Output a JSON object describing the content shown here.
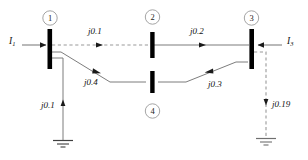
{
  "diagram": {
    "colors": {
      "bus_bar": "#000000",
      "solid_line": "#6b6b6b",
      "dashed_line": "#8d8d8d",
      "text": "#111111",
      "circle_outline": "#9a9a9a",
      "background": "#ffffff"
    },
    "buses": [
      {
        "id": "bus-1",
        "number": "1",
        "x": 48,
        "y": 45
      },
      {
        "id": "bus-2",
        "number": "2",
        "x": 152,
        "y": 43
      },
      {
        "id": "bus-3",
        "number": "3",
        "x": 250,
        "y": 45
      },
      {
        "id": "bus-4",
        "number": "4",
        "x": 152,
        "y": 105
      }
    ],
    "branches": [
      {
        "id": "branch-1-2",
        "label": "j0.1",
        "from": "bus-1",
        "to": "bus-2",
        "style": "dashed"
      },
      {
        "id": "branch-2-3",
        "label": "j0.2",
        "from": "bus-2",
        "to": "bus-3",
        "style": "solid"
      },
      {
        "id": "branch-1-4",
        "label": "j0.4",
        "from": "bus-1",
        "to": "bus-4",
        "style": "solid"
      },
      {
        "id": "branch-4-3",
        "label": "j0.3",
        "from": "bus-4",
        "to": "bus-3",
        "style": "solid"
      }
    ],
    "shunts": [
      {
        "id": "shunt-bus-1",
        "label": "j0.1",
        "bus": "bus-1",
        "style": "solid",
        "arrow": "up"
      },
      {
        "id": "shunt-bus-3",
        "label": "j0.19",
        "bus": "bus-3",
        "style": "dashed",
        "arrow": "down"
      }
    ],
    "injections": [
      {
        "id": "current-source-1",
        "label_main": "I",
        "label_sub": "1",
        "bus": "bus-1",
        "direction": "right"
      },
      {
        "id": "current-source-3",
        "label_main": "I",
        "label_sub": "3",
        "bus": "bus-3",
        "direction": "left"
      }
    ],
    "labels": {
      "imp_1_2": "j0.1",
      "imp_2_3": "j0.2",
      "imp_1_4": "j0.4",
      "imp_4_3": "j0.3",
      "shunt_1": "j0.1",
      "shunt_3": "j0.19",
      "bus_1": "1",
      "bus_2": "2",
      "bus_3": "3",
      "bus_4": "4",
      "current_1_main": "I",
      "current_1_sub": "1",
      "current_3_main": "I",
      "current_3_sub": "3"
    }
  }
}
